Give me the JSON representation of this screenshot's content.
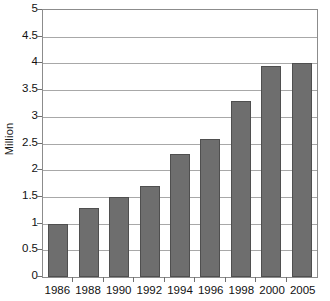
{
  "chart_data": {
    "type": "bar",
    "title": "",
    "subtitle": "",
    "xlabel": "",
    "ylabel": "Million",
    "categories": [
      "1986",
      "1988",
      "1990",
      "1992",
      "1994",
      "1996",
      "1998",
      "2000",
      "2005"
    ],
    "values": [
      1.0,
      1.3,
      1.5,
      1.7,
      2.3,
      2.58,
      3.3,
      3.95,
      4.0
    ],
    "ylim": [
      0,
      5
    ],
    "ytick_labels": [
      "5",
      "4.5",
      "4",
      "3.5",
      "3",
      "2.5",
      "2",
      "1.5",
      "1",
      "0.5",
      "0"
    ],
    "ytick_values": [
      5,
      4.5,
      4,
      3.5,
      3,
      2.5,
      2,
      1.5,
      1,
      0.5,
      0
    ],
    "ytick_step": 0.5,
    "grid": true,
    "grid_axis": "y",
    "legend": false,
    "legend_position": "none",
    "bar_color": "#6e6e6e",
    "bar_edge_color": "#4f4f4f",
    "grid_color": "#a8a8a8",
    "frame_color": "#8c8c8c",
    "background_color": "#ffffff",
    "text_color": "#111111"
  }
}
